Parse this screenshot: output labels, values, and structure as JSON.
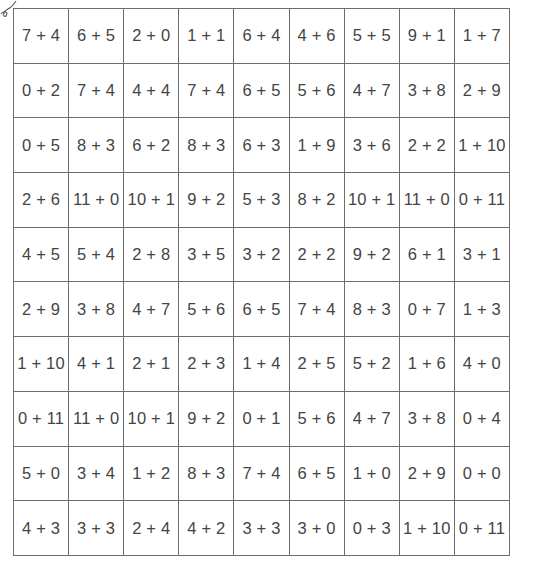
{
  "worksheet": {
    "decoration_icon": "squiggle-icon",
    "columns": 9,
    "rows": [
      [
        "7 + 4",
        "6 + 5",
        "2 + 0",
        "1 + 1",
        "6 + 4",
        "4 + 6",
        "5 + 5",
        "9 + 1",
        "1 + 7"
      ],
      [
        "0 + 2",
        "7 + 4",
        "4 + 4",
        "7 + 4",
        "6 + 5",
        "5 + 6",
        "4 + 7",
        "3 + 8",
        "2 + 9"
      ],
      [
        "0 + 5",
        "8 + 3",
        "6 + 2",
        "8 + 3",
        "6 + 3",
        "1 + 9",
        "3 + 6",
        "2 + 2",
        "1 + 10"
      ],
      [
        "2 + 6",
        "11 + 0",
        "10 + 1",
        "9 + 2",
        "5 + 3",
        "8 + 2",
        "10 + 1",
        "11 + 0",
        "0 + 11"
      ],
      [
        "4 + 5",
        "5 + 4",
        "2 + 8",
        "3 + 5",
        "3 + 2",
        "2 + 2",
        "9 + 2",
        "6 + 1",
        "3 + 1"
      ],
      [
        "2 + 9",
        "3 + 8",
        "4 + 7",
        "5 + 6",
        "6 + 5",
        "7 + 4",
        "8 + 3",
        "0 + 7",
        "1 + 3"
      ],
      [
        "1 + 10",
        "4 + 1",
        "2 + 1",
        "2 + 3",
        "1 + 4",
        "2 + 5",
        "5 + 2",
        "1 + 6",
        "4 + 0"
      ],
      [
        "0 + 11",
        "11 + 0",
        "10 + 1",
        "9 + 2",
        "0 + 1",
        "5 + 6",
        "4 + 7",
        "3 + 8",
        "0 + 4"
      ],
      [
        "5 + 0",
        "3 + 4",
        "1 + 2",
        "8 + 3",
        "7 + 4",
        "6 + 5",
        "1 + 0",
        "2 + 9",
        "0 + 0"
      ],
      [
        "4 + 3",
        "3 + 3",
        "2 + 4",
        "4 + 2",
        "3 + 3",
        "3 + 0",
        "0 + 3",
        "1 + 10",
        "0 + 11"
      ]
    ],
    "colors": {
      "grid_line": "#6e6e6e",
      "text": "#444444",
      "background": "#ffffff"
    }
  }
}
